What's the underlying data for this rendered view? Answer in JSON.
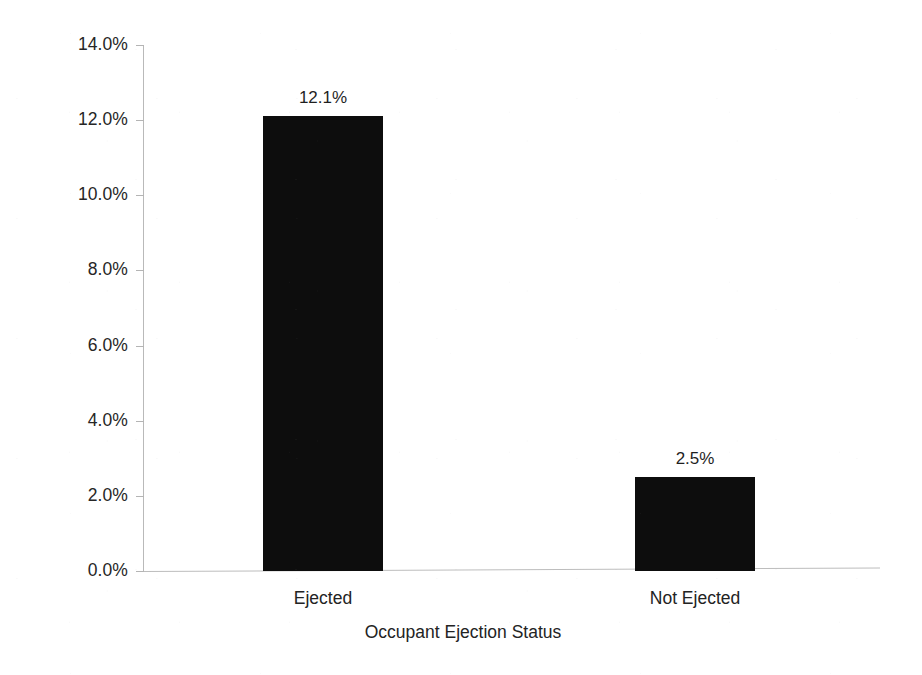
{
  "chart_data": {
    "type": "bar",
    "title": "",
    "xlabel": "Occupant Ejection Status",
    "ylabel": "Percent of Occupants Who Died",
    "categories": [
      "Ejected",
      "Not Ejected"
    ],
    "values": [
      12.1,
      2.5
    ],
    "value_labels": [
      "12.1%",
      "2.5%"
    ],
    "ylim": [
      0,
      14
    ],
    "ytick_values": [
      0,
      2,
      4,
      6,
      8,
      10,
      12,
      14
    ],
    "ytick_labels": [
      "0.0%",
      "2.0%",
      "4.0%",
      "6.0%",
      "8.0%",
      "10.0%",
      "12.0%",
      "14.0%"
    ],
    "grid": false,
    "legend": false,
    "legend_position": "none",
    "bar_color": "#0d0d0d",
    "axis_color": "#b9b9b9",
    "background_color": "#ffffff"
  }
}
